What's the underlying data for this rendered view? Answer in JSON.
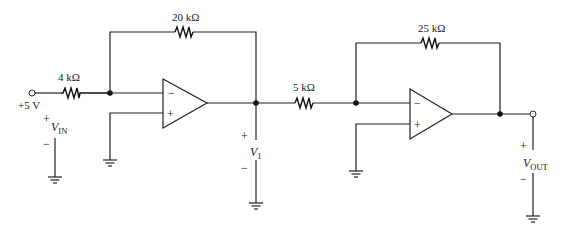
{
  "diagram": {
    "type": "circuit-schematic",
    "input": {
      "source_label": "+5 V",
      "voltage_label": "V",
      "voltage_sub": "IN",
      "plus": "+",
      "minus": "−"
    },
    "stage1": {
      "input_resistor": "4 kΩ",
      "feedback_resistor": "20 kΩ",
      "opamp_inverting": "−",
      "opamp_noninverting": "+",
      "output_voltage_label": "V",
      "output_voltage_sub": "1",
      "plus": "+",
      "minus": "−"
    },
    "stage2": {
      "input_resistor": "5 kΩ",
      "feedback_resistor": "25 kΩ",
      "opamp_inverting": "−",
      "opamp_noninverting": "+"
    },
    "output": {
      "voltage_label": "V",
      "voltage_sub": "OUT",
      "plus": "+",
      "minus": "−"
    },
    "colors": {
      "line": "#222222",
      "background": "#ffffff"
    }
  }
}
